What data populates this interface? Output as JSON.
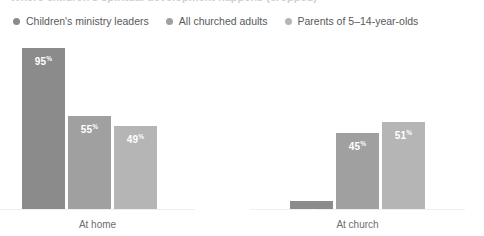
{
  "title": {
    "text": "Where children's spiritual development happens (cropped)"
  },
  "legend": {
    "position": "top-left",
    "items": [
      {
        "label": "Children's ministry leaders",
        "color": "#8b8b8b",
        "icon": "legend-dot-icon"
      },
      {
        "label": "All churched adults",
        "color": "#a0a0a0",
        "icon": "legend-dot-icon"
      },
      {
        "label": "Parents of 5–14-year-olds",
        "color": "#b5b5b5",
        "icon": "legend-dot-icon"
      }
    ]
  },
  "chart_data": {
    "type": "bar",
    "title": "",
    "xlabel": "",
    "ylabel": "",
    "ylim": [
      0,
      100
    ],
    "grid": false,
    "legend_position": "top-left",
    "categories": [
      "At home",
      "At church"
    ],
    "series": [
      {
        "name": "Children's ministry leaders",
        "color": "#8b8b8b",
        "values": [
          95,
          5
        ],
        "labels": [
          "95",
          "5"
        ]
      },
      {
        "name": "All churched adults",
        "color": "#a0a0a0",
        "values": [
          55,
          45
        ],
        "labels": [
          "55",
          "45"
        ]
      },
      {
        "name": "Parents of 5–14-year-olds",
        "color": "#b5b5b5",
        "values": [
          49,
          51
        ],
        "labels": [
          "49",
          "51"
        ]
      }
    ],
    "value_suffix": "%"
  }
}
